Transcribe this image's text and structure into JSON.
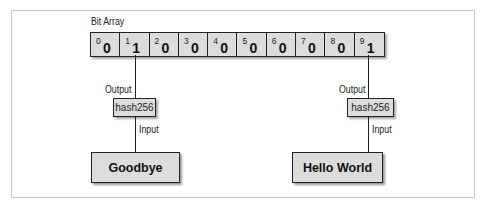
{
  "diagram": {
    "bit_array": {
      "title": "Bit Array",
      "cells": [
        {
          "index": "0",
          "value": "0"
        },
        {
          "index": "1",
          "value": "1"
        },
        {
          "index": "2",
          "value": "0"
        },
        {
          "index": "3",
          "value": "0"
        },
        {
          "index": "4",
          "value": "0"
        },
        {
          "index": "5",
          "value": "0"
        },
        {
          "index": "6",
          "value": "0"
        },
        {
          "index": "7",
          "value": "0"
        },
        {
          "index": "8",
          "value": "0"
        },
        {
          "index": "9",
          "value": "1"
        }
      ]
    },
    "left_branch": {
      "output_label": "Output",
      "hash_label": "hash256",
      "input_label": "Input",
      "input_value": "Goodbye",
      "target_index": 1
    },
    "right_branch": {
      "output_label": "Output",
      "hash_label": "hash256",
      "input_label": "Input",
      "input_value": "Hello World",
      "target_index": 9
    },
    "colors": {
      "box_fill": "#dcdcdc",
      "stroke": "#222222",
      "frame": "#c8c8c8"
    }
  }
}
